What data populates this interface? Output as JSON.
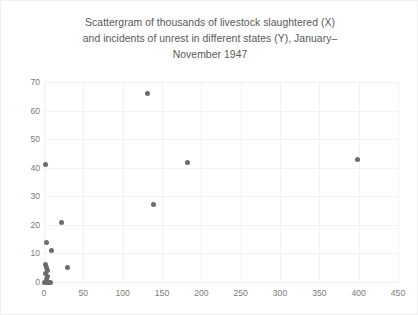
{
  "chart_data": {
    "type": "scatter",
    "title": "Scattergram of thousands of livestock slaughtered (X)\nand incidents of unrest in different states (Y), January–\nNovember 1947",
    "xlabel": "",
    "ylabel": "",
    "xlim": [
      0,
      450
    ],
    "ylim": [
      0,
      70
    ],
    "x_ticks": [
      0,
      50,
      100,
      150,
      200,
      250,
      300,
      350,
      400,
      450
    ],
    "y_ticks": [
      0,
      10,
      20,
      30,
      40,
      50,
      60,
      70
    ],
    "grid": true,
    "legend": null,
    "marker_color": "#6b6b6b",
    "points": [
      {
        "x": 1,
        "y": 0
      },
      {
        "x": 2,
        "y": 0
      },
      {
        "x": 4,
        "y": 0
      },
      {
        "x": 6,
        "y": 0
      },
      {
        "x": 8,
        "y": 0
      },
      {
        "x": 3,
        "y": 1
      },
      {
        "x": 5,
        "y": 2
      },
      {
        "x": 2,
        "y": 3
      },
      {
        "x": 4,
        "y": 4
      },
      {
        "x": 3,
        "y": 5
      },
      {
        "x": 2,
        "y": 6
      },
      {
        "x": 30,
        "y": 5
      },
      {
        "x": 10,
        "y": 11
      },
      {
        "x": 3,
        "y": 14
      },
      {
        "x": 22,
        "y": 21
      },
      {
        "x": 2,
        "y": 41
      },
      {
        "x": 139,
        "y": 27
      },
      {
        "x": 131,
        "y": 66
      },
      {
        "x": 182,
        "y": 42
      },
      {
        "x": 398,
        "y": 43
      }
    ]
  },
  "colors": {
    "marker": "#6b6b6b",
    "gridline": "#f2f2f2",
    "axis": "#d9d9d9",
    "text": "#7a7a7a",
    "title": "#585858",
    "background": "#ffffff"
  }
}
